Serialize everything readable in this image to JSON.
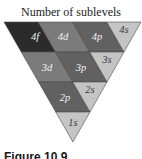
{
  "figure": {
    "title": "Number of sublevels",
    "caption": "Figure 10.9"
  },
  "colors": {
    "f": "#2b2b2b",
    "d": "#7b7b7b",
    "p": "#616161",
    "s": "#c4c4c4",
    "label_on_dark": "#f2f2f2",
    "label_on_light": "#3a3a3a",
    "border": "#4a4a4a"
  },
  "rows": [
    {
      "level": 4,
      "cells": [
        {
          "label": "4f",
          "type": "f",
          "points": "4,22 38.25,22 55.5,52 21.25,52",
          "lx": 35,
          "ly": 40
        },
        {
          "label": "4d",
          "type": "d",
          "points": "38.25,22 72.5,22 89.75,52 55.5,52",
          "lx": 63,
          "ly": 40
        },
        {
          "label": "4p",
          "type": "p",
          "points": "72.5,22 106.75,22 124,52 89.75,52",
          "lx": 97,
          "ly": 40
        },
        {
          "label": "4s",
          "type": "s",
          "points": "106.75,22 141,22 124,52",
          "lx": 124,
          "ly": 33
        }
      ]
    },
    {
      "level": 3,
      "cells": [
        {
          "label": "3d",
          "type": "d",
          "points": "21.25,52 55.5,52 72.75,82 38.5,82",
          "lx": 47,
          "ly": 71
        },
        {
          "label": "3p",
          "type": "p",
          "points": "55.5,52 89.75,52 107,82 72.75,82",
          "lx": 81,
          "ly": 71
        },
        {
          "label": "3s",
          "type": "s",
          "points": "89.75,52 124,52 107,82",
          "lx": 107,
          "ly": 63
        }
      ]
    },
    {
      "level": 2,
      "cells": [
        {
          "label": "2p",
          "type": "p",
          "points": "38.5,82 72.75,82 90,112 55.75,112",
          "lx": 65,
          "ly": 101
        },
        {
          "label": "2s",
          "type": "s",
          "points": "72.75,82 107,82 90,112",
          "lx": 90,
          "ly": 93
        }
      ]
    },
    {
      "level": 1,
      "cells": [
        {
          "label": "1s",
          "type": "s",
          "points": "55.75,112 90,112 72.9,142",
          "lx": 73,
          "ly": 126
        }
      ]
    }
  ]
}
